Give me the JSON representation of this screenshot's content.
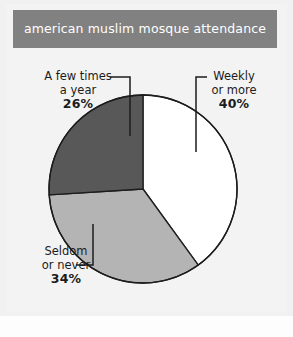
{
  "header": {
    "title": "american muslim mosque attendance",
    "bar_color": "#818181",
    "title_color": "#ffffff"
  },
  "page": {
    "background": "#f3f3f3"
  },
  "labels": {
    "a_few_times": {
      "line1": "A few times",
      "line2": "a year",
      "percent": "26%"
    },
    "weekly": {
      "line1": "Weekly",
      "line2": "or more",
      "percent": "40%"
    },
    "seldom": {
      "line1": "Seldom",
      "line2": "or never",
      "percent": "34%"
    }
  },
  "chart_data": {
    "type": "pie",
    "title": "american muslim mosque attendance",
    "xlabel": "",
    "ylabel": "",
    "legend_position": "none",
    "grid": false,
    "start_angle_deg": 0,
    "direction": "clockwise",
    "center": [
      143,
      189
    ],
    "radius": 94,
    "outline_color": "#1c1c1c",
    "categories": [
      "Weekly or more",
      "Seldom or never",
      "A few times a year"
    ],
    "values": [
      40,
      34,
      26
    ],
    "value_labels": [
      "40%",
      "34%",
      "26%"
    ],
    "colors": [
      "#ffffff",
      "#b4b4b4",
      "#585858"
    ],
    "slices": [
      {
        "label": "Weekly or more",
        "value": 40,
        "value_label": "40%",
        "color": "#ffffff",
        "start_deg": 0,
        "end_deg": 144
      },
      {
        "label": "Seldom or never",
        "value": 34,
        "value_label": "34%",
        "color": "#b4b4b4",
        "start_deg": 144,
        "end_deg": 266.4
      },
      {
        "label": "A few times a year",
        "value": 26,
        "value_label": "26%",
        "color": "#585858",
        "start_deg": 266.4,
        "end_deg": 360
      }
    ]
  }
}
